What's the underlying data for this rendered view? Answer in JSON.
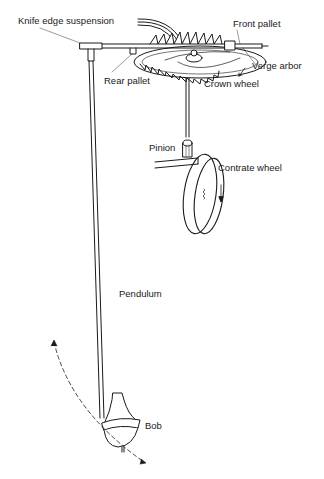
{
  "diagram": {
    "labels": {
      "knife_edge_suspension": "Knife edge suspension",
      "front_pallet": "Front pallet",
      "verge_arbor": "Verge arbor",
      "rear_pallet": "Rear pallet",
      "crown_wheel": "Crown wheel",
      "pinion": "Pinion",
      "contrate_wheel": "Contrate wheel",
      "pendulum": "Pendulum",
      "bob": "Bob"
    },
    "colors": {
      "ink": "#1a1a1a",
      "background": "#ffffff"
    }
  }
}
